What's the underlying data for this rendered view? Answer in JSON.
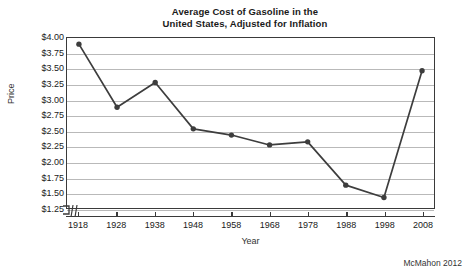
{
  "chart_data": {
    "type": "line",
    "title": "Average Cost of Gasoline in the United States, Adjusted for Inflation",
    "title_lines": [
      "Average Cost of Gasoline in the",
      "United States, Adjusted for Inflation"
    ],
    "xlabel": "Year",
    "ylabel": "Price",
    "x": [
      1918,
      1928,
      1938,
      1948,
      1958,
      1968,
      1978,
      1988,
      1998,
      2008
    ],
    "values": [
      3.9,
      2.88,
      3.28,
      2.53,
      2.43,
      2.27,
      2.32,
      1.62,
      1.42,
      3.47
    ],
    "series": [
      {
        "name": "Average gasoline price (inflation adjusted)",
        "values": [
          3.9,
          2.88,
          3.28,
          2.53,
          2.43,
          2.27,
          2.32,
          1.62,
          1.42,
          3.47
        ]
      }
    ],
    "xtick_labels": [
      "1918",
      "1928",
      "1938",
      "1948",
      "1958",
      "1968",
      "1978",
      "1988",
      "1998",
      "2008"
    ],
    "ytick_values": [
      1.25,
      1.5,
      1.75,
      2.0,
      2.25,
      2.5,
      2.75,
      3.0,
      3.25,
      3.5,
      3.75,
      4.0
    ],
    "ytick_labels": [
      "$1.25",
      "$1.50",
      "$1.75",
      "$2.00",
      "$2.25",
      "$2.50",
      "$2.75",
      "$3.00",
      "$3.25",
      "$3.50",
      "$3.75",
      "$4.00"
    ],
    "ylim": [
      1.25,
      4.0
    ],
    "xlim": [
      1918,
      2008
    ],
    "grid": "horizontal",
    "legend": "none",
    "axis_break": true,
    "marker": "circle",
    "line_color": "#3d3d3d",
    "marker_color": "#3d3d3d",
    "grid_color": "#b9b9b9",
    "frame_color": "#3a3a3a",
    "background_color": "#ffffff"
  },
  "credit": {
    "text": "McMahon 2012"
  }
}
